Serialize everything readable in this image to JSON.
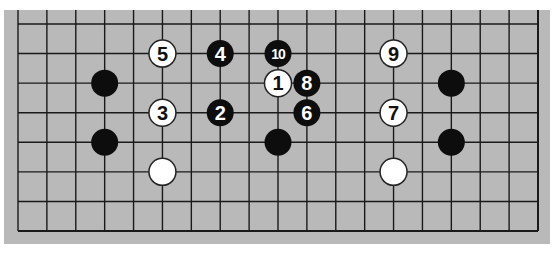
{
  "diagram": {
    "type": "go-board-fragment",
    "colors": {
      "page_background": "#ffffff",
      "board_background": "#b9b9b9",
      "grid_line": "#1a1a1a",
      "black_stone": "#0d0d0d",
      "white_stone": "#ffffff",
      "white_stone_border": "#222222",
      "black_stone_number": "#ffffff",
      "white_stone_number": "#111111"
    },
    "grid": {
      "columns": 19,
      "rows": 8,
      "x0": 18,
      "x1": 538,
      "y0": 24,
      "y1": 231
    },
    "stones": [
      {
        "col": 5,
        "row": 1,
        "color": "white",
        "label": "5"
      },
      {
        "col": 7,
        "row": 1,
        "color": "black",
        "label": "4"
      },
      {
        "col": 9,
        "row": 1,
        "color": "black",
        "label": "10"
      },
      {
        "col": 13,
        "row": 1,
        "color": "white",
        "label": "9"
      },
      {
        "col": 3,
        "row": 2,
        "color": "black",
        "label": ""
      },
      {
        "col": 9,
        "row": 2,
        "color": "white",
        "label": "1"
      },
      {
        "col": 10,
        "row": 2,
        "color": "black",
        "label": "8"
      },
      {
        "col": 15,
        "row": 2,
        "color": "black",
        "label": ""
      },
      {
        "col": 5,
        "row": 3,
        "color": "white",
        "label": "3"
      },
      {
        "col": 7,
        "row": 3,
        "color": "black",
        "label": "2"
      },
      {
        "col": 10,
        "row": 3,
        "color": "black",
        "label": "6"
      },
      {
        "col": 13,
        "row": 3,
        "color": "white",
        "label": "7"
      },
      {
        "col": 3,
        "row": 4,
        "color": "black",
        "label": ""
      },
      {
        "col": 9,
        "row": 4,
        "color": "black",
        "label": ""
      },
      {
        "col": 15,
        "row": 4,
        "color": "black",
        "label": ""
      },
      {
        "col": 5,
        "row": 5,
        "color": "white",
        "label": ""
      },
      {
        "col": 13,
        "row": 5,
        "color": "white",
        "label": ""
      }
    ]
  }
}
